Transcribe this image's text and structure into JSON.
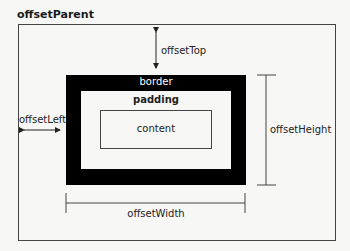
{
  "diagram": {
    "title": "offsetParent",
    "labels": {
      "border": "border",
      "padding": "padding",
      "content": "content",
      "offset_top": "offsetTop",
      "offset_left": "offsetLeft",
      "offset_height": "offsetHeight",
      "offset_width": "offsetWidth"
    },
    "colors": {
      "background": "#f7f7f5",
      "border_fill": "#000000",
      "line": "#444444",
      "text": "#222222"
    }
  }
}
